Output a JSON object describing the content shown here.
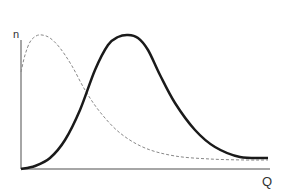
{
  "chart_data": {
    "type": "line",
    "title": "",
    "xlabel": "Q",
    "ylabel": "n",
    "grid": false,
    "legend": null,
    "series": [
      {
        "name": "dashed curve",
        "style": "dashed",
        "color": "#888888",
        "points": [
          [
            21,
            72
          ],
          [
            25,
            55
          ],
          [
            30,
            42
          ],
          [
            36,
            36
          ],
          [
            42,
            35
          ],
          [
            50,
            38
          ],
          [
            60,
            48
          ],
          [
            72,
            66
          ],
          [
            85,
            90
          ],
          [
            100,
            112
          ],
          [
            120,
            133
          ],
          [
            145,
            148
          ],
          [
            175,
            156
          ],
          [
            210,
            159
          ],
          [
            245,
            160
          ],
          [
            268,
            160
          ]
        ]
      },
      {
        "name": "solid curve",
        "style": "solid",
        "color": "#1a1a1a",
        "points": [
          [
            21,
            169
          ],
          [
            35,
            166
          ],
          [
            50,
            158
          ],
          [
            65,
            140
          ],
          [
            80,
            110
          ],
          [
            95,
            70
          ],
          [
            108,
            45
          ],
          [
            118,
            37
          ],
          [
            128,
            35
          ],
          [
            138,
            38
          ],
          [
            148,
            50
          ],
          [
            160,
            75
          ],
          [
            175,
            103
          ],
          [
            195,
            130
          ],
          [
            215,
            147
          ],
          [
            240,
            157
          ],
          [
            268,
            158
          ]
        ]
      }
    ],
    "axes": {
      "origin": [
        21,
        169
      ],
      "x_end": 270,
      "y_top": 40
    }
  },
  "labels": {
    "y_axis": "n",
    "x_axis": "Q"
  }
}
